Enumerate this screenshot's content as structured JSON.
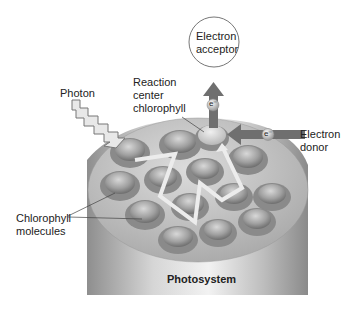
{
  "diagram": {
    "title": "Photosystem",
    "labels": {
      "electron_acceptor_line1": "Electron",
      "electron_acceptor_line2": "acceptor",
      "photon": "Photon",
      "reaction_center_line1": "Reaction",
      "reaction_center_line2": "center",
      "reaction_center_line3": "chlorophyll",
      "electron_donor_line1": "Electron",
      "electron_donor_line2": "donor",
      "chlorophyll_line1": "Chlorophyll",
      "chlorophyll_line2": "molecules",
      "photosystem": "Photosystem",
      "electron_symbol_top": "e⁻",
      "electron_symbol_right": "e⁻"
    },
    "colors": {
      "arrow": "#6f6f6f",
      "cylinder": "#a9a9a9",
      "disc": "#c2c2c2",
      "path": "#ececec"
    }
  }
}
